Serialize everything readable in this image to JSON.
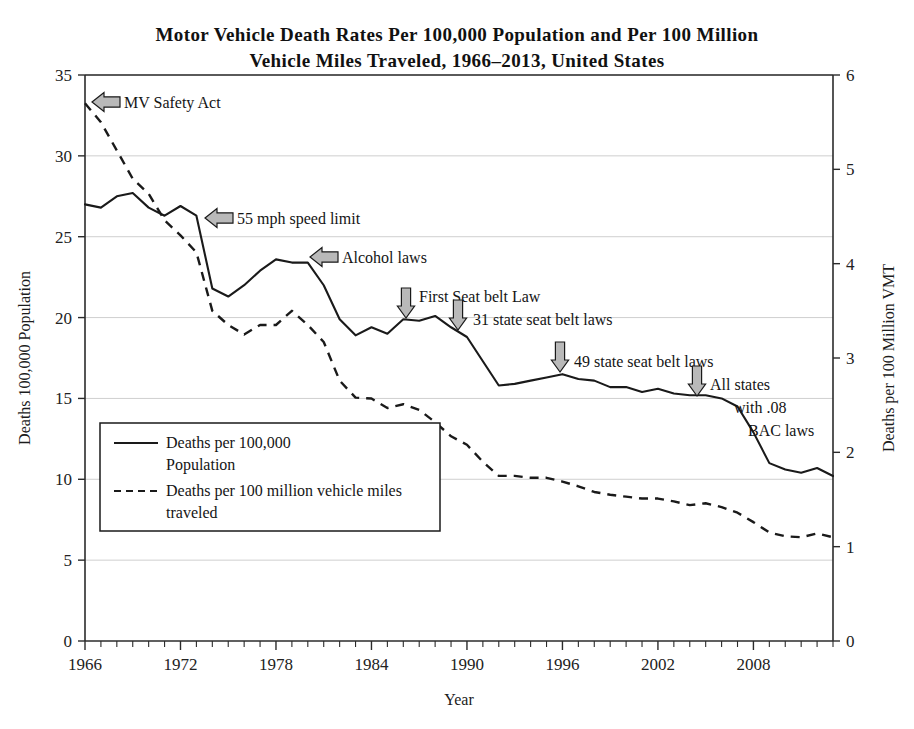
{
  "chart_data": {
    "type": "line",
    "title": "Motor Vehicle Death Rates Per 100,000 Population and Per 100 Million Vehicle Miles Traveled, 1966–2013, United States",
    "title_line1": "Motor Vehicle Death Rates Per 100,000 Population and Per 100 Million",
    "title_line2": "Vehicle Miles Traveled, 1966–2013, United States",
    "xlabel": "Year",
    "ylabel": "Deaths 100,000 Population",
    "ylabel_right": "Deaths per 100 Million VMT",
    "xlim": [
      1966,
      2013
    ],
    "ylim": [
      0,
      35
    ],
    "ylim_right": [
      0,
      6
    ],
    "grid": true,
    "legend_position": "lower-left-inside",
    "xticks": [
      1966,
      1972,
      1978,
      1984,
      1990,
      1996,
      2002,
      2008
    ],
    "xtick_labels": [
      "1966",
      "1972",
      "1978",
      "1984",
      "1990",
      "1996",
      "2002",
      "2008"
    ],
    "yticks": [
      0,
      5,
      10,
      15,
      20,
      25,
      30,
      35
    ],
    "ytick_labels": [
      "0",
      "5",
      "10",
      "15",
      "20",
      "25",
      "30",
      "35"
    ],
    "yticks_right": [
      0,
      1,
      2,
      3,
      4,
      5,
      6
    ],
    "ytick_labels_right": [
      "0",
      "1",
      "2",
      "3",
      "4",
      "5",
      "6"
    ],
    "x": [
      1966,
      1967,
      1968,
      1969,
      1970,
      1971,
      1972,
      1973,
      1974,
      1975,
      1976,
      1977,
      1978,
      1979,
      1980,
      1981,
      1982,
      1983,
      1984,
      1985,
      1986,
      1987,
      1988,
      1989,
      1990,
      1991,
      1992,
      1993,
      1994,
      1995,
      1996,
      1997,
      1998,
      1999,
      2000,
      2001,
      2002,
      2003,
      2004,
      2005,
      2006,
      2007,
      2008,
      2009,
      2010,
      2011,
      2012,
      2013
    ],
    "series": [
      {
        "name": "Deaths per 100,000 Population",
        "axis": "left",
        "style": "solid",
        "values": [
          27.0,
          26.8,
          27.5,
          27.7,
          26.8,
          26.3,
          26.9,
          26.3,
          21.8,
          21.3,
          22.0,
          22.9,
          23.6,
          23.4,
          23.4,
          22.0,
          19.9,
          18.9,
          19.4,
          19.0,
          19.9,
          19.8,
          20.1,
          19.4,
          18.8,
          17.3,
          15.8,
          15.9,
          16.1,
          16.3,
          16.5,
          16.2,
          16.1,
          15.7,
          15.7,
          15.4,
          15.6,
          15.3,
          15.2,
          15.2,
          15.0,
          14.5,
          12.9,
          11.0,
          10.6,
          10.4,
          10.7,
          10.2
        ]
      },
      {
        "name": "Deaths per 100 million vehicle miles traveled",
        "axis": "right",
        "style": "dashed",
        "values": [
          5.7,
          5.5,
          5.2,
          4.9,
          4.74,
          4.46,
          4.3,
          4.12,
          3.5,
          3.35,
          3.25,
          3.35,
          3.35,
          3.5,
          3.35,
          3.17,
          2.76,
          2.58,
          2.57,
          2.47,
          2.51,
          2.45,
          2.32,
          2.17,
          2.08,
          1.9,
          1.75,
          1.75,
          1.73,
          1.73,
          1.69,
          1.64,
          1.58,
          1.55,
          1.53,
          1.51,
          1.51,
          1.48,
          1.44,
          1.46,
          1.42,
          1.36,
          1.26,
          1.15,
          1.11,
          1.1,
          1.14,
          1.1
        ]
      }
    ],
    "annotations": [
      {
        "id": "mv-safety-act",
        "label": "MV Safety Act",
        "arrow": "left",
        "series": "dashed",
        "year": 1966,
        "value": 5.7
      },
      {
        "id": "speed-limit-55",
        "label": "55 mph speed limit",
        "arrow": "left",
        "series": "solid",
        "year": 1974,
        "value": 26.3
      },
      {
        "id": "alcohol-laws",
        "label": "Alcohol laws",
        "arrow": "left",
        "series": "solid",
        "year": 1980,
        "value": 23.4
      },
      {
        "id": "first-seat-belt-law",
        "label": "First Seat belt Law",
        "arrow": "down",
        "series": "solid",
        "year": 1987,
        "value": 19.8
      },
      {
        "id": "31-state-seat-belt-laws",
        "label": "31 state seat belt laws",
        "arrow": "down",
        "series": "solid",
        "year": 1990,
        "value": 18.8
      },
      {
        "id": "49-state-seat-belt-laws",
        "label": "49 state seat belt laws",
        "arrow": "down",
        "series": "solid",
        "year": 1997,
        "value": 16.2
      },
      {
        "id": "all-states-bac",
        "label": "All states",
        "label_line2": "with .08",
        "label_line3": "BAC laws",
        "arrow": "down",
        "series": "solid",
        "year": 2005,
        "value": 15.2
      }
    ],
    "legend": [
      {
        "style": "solid",
        "line1": "Deaths per 100,000",
        "line2": "Population"
      },
      {
        "style": "dashed",
        "line1": "Deaths per 100 million vehicle miles",
        "line2": "traveled"
      }
    ],
    "colors": {
      "line": "#1a1a1a",
      "grid": "#c9c9c9",
      "axis": "#2b2b2b",
      "arrow_fill": "#b9b9b9",
      "background": "#ffffff"
    }
  }
}
